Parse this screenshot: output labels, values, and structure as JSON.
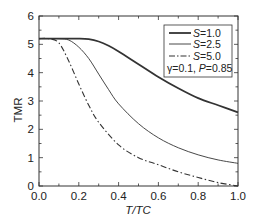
{
  "chart_data": {
    "type": "line",
    "title": "",
    "xlabel": "T/TC",
    "ylabel": "TMR",
    "xlim": [
      0.0,
      1.0
    ],
    "ylim": [
      0,
      6
    ],
    "xticks": [
      "0.0",
      "0.2",
      "0.4",
      "0.6",
      "0.8",
      "1.0"
    ],
    "yticks": [
      "0",
      "1",
      "2",
      "3",
      "4",
      "5",
      "6"
    ],
    "grid": false,
    "legend_position": "upper right",
    "annotation": "γ=0.1, P=0.85",
    "series": [
      {
        "name": "S=1.0",
        "style": "solid-thick",
        "x": [
          0.0,
          0.1,
          0.2,
          0.25,
          0.3,
          0.35,
          0.4,
          0.5,
          0.6,
          0.7,
          0.8,
          0.9,
          1.0
        ],
        "y": [
          5.2,
          5.2,
          5.2,
          5.18,
          5.1,
          4.95,
          4.75,
          4.3,
          3.85,
          3.45,
          3.1,
          2.85,
          2.6
        ]
      },
      {
        "name": "S=2.5",
        "style": "solid-thin",
        "x": [
          0.0,
          0.1,
          0.15,
          0.2,
          0.25,
          0.3,
          0.35,
          0.4,
          0.5,
          0.6,
          0.7,
          0.8,
          0.9,
          1.0
        ],
        "y": [
          5.2,
          5.2,
          5.15,
          4.9,
          4.5,
          3.95,
          3.4,
          2.9,
          2.2,
          1.7,
          1.35,
          1.1,
          0.92,
          0.8
        ]
      },
      {
        "name": "S=5.0",
        "style": "dash-dot",
        "x": [
          0.0,
          0.05,
          0.1,
          0.15,
          0.2,
          0.25,
          0.3,
          0.4,
          0.5,
          0.6,
          0.7,
          0.8,
          0.9,
          1.0
        ],
        "y": [
          5.2,
          5.2,
          5.05,
          4.4,
          3.6,
          2.85,
          2.25,
          1.45,
          1.0,
          0.75,
          0.5,
          0.3,
          0.12,
          0.0
        ]
      }
    ]
  },
  "legend": {
    "items": [
      "=1.0",
      "=2.5",
      "=5.0"
    ],
    "var": "S",
    "note_gamma": "γ=0.1, ",
    "note_p_var": "P",
    "note_p_val": "=0.85"
  },
  "axes": {
    "xlabel": "T/TC",
    "ylabel": "TMR"
  }
}
